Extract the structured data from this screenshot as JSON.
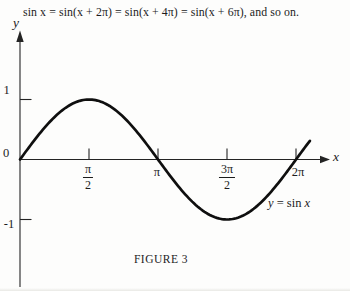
{
  "colors": {
    "ink": "#242424",
    "curve": "#0f0f0f",
    "background": "#fdfdfc"
  },
  "heading": {
    "text": "sin x = sin(x + 2π) = sin(x + 4π) = sin(x + 6π), and so on."
  },
  "figure": {
    "caption": "FIGURE 3"
  },
  "axes": {
    "x_axis_label": "x",
    "y_axis_label": "y",
    "origin_label": "0",
    "y_ticks": [
      {
        "label": "1"
      },
      {
        "label": "-1"
      }
    ],
    "x_ticks": [
      {
        "num": "π",
        "den": "2"
      },
      {
        "text": "π"
      },
      {
        "num": "3π",
        "den": "2"
      },
      {
        "text": "2π"
      }
    ]
  },
  "curve": {
    "label_lhs": "y",
    "label_eq": " = sin ",
    "label_rhs": "x"
  },
  "chart_data": {
    "type": "line",
    "title": "FIGURE 3",
    "function": "y = sin(x)",
    "series": [
      {
        "name": "y = sin x",
        "amplitude": 1,
        "period_rad": 6.2832,
        "x_start_rad": 0,
        "x_end_rad": 6.62
      }
    ],
    "x_ticks": [
      {
        "value_rad": 1.5708,
        "label": "π/2"
      },
      {
        "value_rad": 3.1416,
        "label": "π"
      },
      {
        "value_rad": 4.7124,
        "label": "3π/2"
      },
      {
        "value_rad": 6.2832,
        "label": "2π"
      }
    ],
    "y_ticks": [
      1,
      -1
    ],
    "xlim_rad": [
      0,
      7.1
    ],
    "ylim": [
      -1.35,
      2.1
    ],
    "grid": false,
    "legend": "none",
    "annotation": "y = sin x",
    "key_points": [
      {
        "x": "0",
        "y": 0
      },
      {
        "x": "π/2",
        "y": 1
      },
      {
        "x": "π",
        "y": 0
      },
      {
        "x": "3π/2",
        "y": -1
      },
      {
        "x": "2π",
        "y": 0
      }
    ]
  }
}
